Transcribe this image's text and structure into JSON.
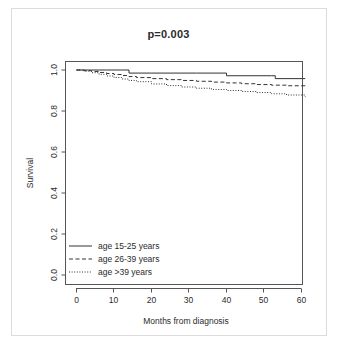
{
  "figure": {
    "title": "p=0.003"
  },
  "axes": {
    "xlabel": "Months from diagnosis",
    "ylabel": "Survival",
    "xticks": [
      "0",
      "10",
      "20",
      "30",
      "40",
      "50",
      "60"
    ],
    "yticks": [
      "0.0",
      "0.2",
      "0.4",
      "0.6",
      "0.8",
      "1.0"
    ]
  },
  "legend": {
    "items": [
      {
        "label": "age 15-25 years",
        "style": "solid"
      },
      {
        "label": "age 26-39 years",
        "style": "dashed"
      },
      {
        "label": "age >39 years",
        "style": "dotted"
      }
    ]
  },
  "chart_data": {
    "type": "line",
    "title": "p=0.003",
    "xlabel": "Months from diagnosis",
    "ylabel": "Survival",
    "xlim": [
      0,
      62
    ],
    "ylim": [
      0.0,
      1.04
    ],
    "xticks": [
      0,
      10,
      20,
      30,
      40,
      50,
      60
    ],
    "yticks": [
      0.0,
      0.2,
      0.4,
      0.6,
      0.8,
      1.0
    ],
    "grid": false,
    "legend_position": "lower left",
    "annotations": [
      "p=0.003"
    ],
    "series": [
      {
        "name": "age 15-25 years",
        "style": "solid",
        "step": "post",
        "x": [
          0,
          2,
          4,
          6,
          8,
          10,
          12,
          14,
          20,
          26,
          32,
          38,
          40,
          46,
          52,
          53,
          58,
          61
        ],
        "y": [
          1.0,
          1.0,
          1.0,
          1.0,
          1.0,
          1.0,
          1.0,
          0.985,
          0.985,
          0.985,
          0.985,
          0.985,
          0.972,
          0.972,
          0.972,
          0.958,
          0.958,
          0.958
        ]
      },
      {
        "name": "age 26-39 years",
        "style": "dashed",
        "step": "post",
        "x": [
          0,
          2,
          4,
          6,
          8,
          10,
          12,
          14,
          16,
          20,
          24,
          28,
          32,
          36,
          40,
          44,
          48,
          52,
          56,
          61
        ],
        "y": [
          1.0,
          0.997,
          0.993,
          0.988,
          0.983,
          0.978,
          0.973,
          0.968,
          0.963,
          0.958,
          0.953,
          0.949,
          0.945,
          0.941,
          0.937,
          0.933,
          0.929,
          0.926,
          0.923,
          0.917
        ]
      },
      {
        "name": "age >39 years",
        "style": "dotted",
        "step": "post",
        "x": [
          0,
          2,
          4,
          6,
          8,
          10,
          12,
          14,
          16,
          20,
          24,
          28,
          32,
          36,
          40,
          44,
          48,
          52,
          56,
          61
        ],
        "y": [
          1.0,
          0.994,
          0.987,
          0.979,
          0.971,
          0.963,
          0.956,
          0.949,
          0.943,
          0.932,
          0.924,
          0.917,
          0.911,
          0.905,
          0.9,
          0.895,
          0.89,
          0.884,
          0.878,
          0.87
        ]
      }
    ]
  }
}
